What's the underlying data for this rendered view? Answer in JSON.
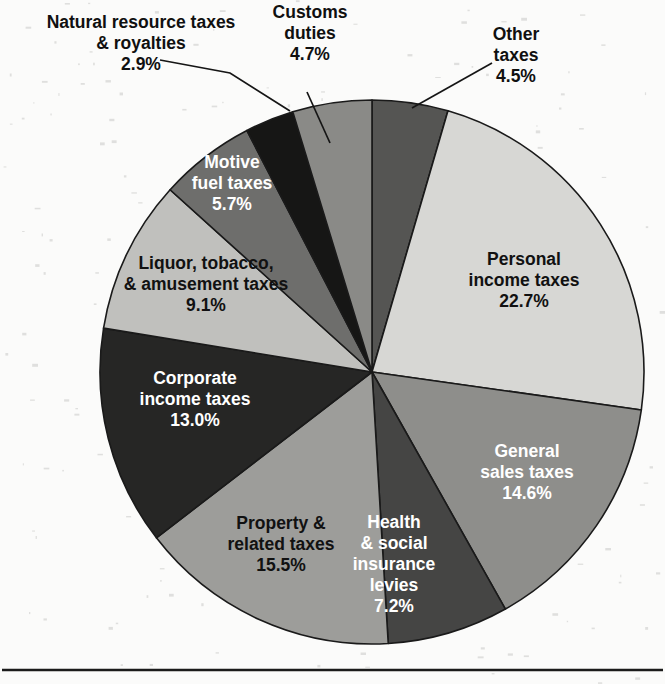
{
  "chart_data": {
    "type": "pie",
    "title": "",
    "subtitle": "",
    "xlabel": "",
    "ylabel": "",
    "legend_position": "none",
    "grid": false,
    "units": "percent",
    "total": 99.9,
    "start_angle_deg": 0,
    "direction": "clockwise",
    "center": {
      "x": 372,
      "y": 372
    },
    "radius": 272,
    "categories": [
      "Other taxes",
      "Personal income taxes",
      "General sales taxes",
      "Health & social insurance levies",
      "Property & related taxes",
      "Corporate income taxes",
      "Liquor, tobacco, & amusement taxes",
      "Motive fuel taxes",
      "Natural resource taxes & royalties",
      "Customs duties"
    ],
    "values": [
      4.5,
      22.7,
      14.6,
      7.2,
      15.5,
      13.0,
      9.1,
      5.7,
      2.9,
      4.7
    ],
    "value_labels": [
      "4.5%",
      "22.7%",
      "14.6%",
      "7.2%",
      "15.5%",
      "13.0%",
      "9.1%",
      "5.7%",
      "2.9%",
      "4.7%"
    ],
    "slice_colors": [
      "#555553",
      "#d7d7d4",
      "#8e8e8b",
      "#454544",
      "#9d9d9a",
      "#262625",
      "#c0c0bd",
      "#6e6e6c",
      "#161615",
      "#8a8a87"
    ],
    "slices": [
      {
        "name": "other-taxes",
        "label_lines": [
          "Other",
          "taxes"
        ],
        "value_label": "4.5%",
        "value": 4.5,
        "color": "#555553",
        "label_placement": "callout",
        "text_color": "#101010",
        "label_x": 516,
        "label_y": 56,
        "leader": "M 412 108 L 492 63"
      },
      {
        "name": "personal-income-taxes",
        "label_lines": [
          "Personal",
          "income taxes"
        ],
        "value_label": "22.7%",
        "value": 22.7,
        "color": "#d7d7d4",
        "label_placement": "inside",
        "text_color": "#111111",
        "label_x": 524,
        "label_y": 281
      },
      {
        "name": "general-sales-taxes",
        "label_lines": [
          "General",
          "sales taxes"
        ],
        "value_label": "14.6%",
        "value": 14.6,
        "color": "#8e8e8b",
        "label_placement": "inside",
        "text_color": "#ffffff",
        "label_x": 527,
        "label_y": 473
      },
      {
        "name": "health-social-insurance-levies",
        "label_lines": [
          "Health",
          "& social",
          "insurance",
          "levies"
        ],
        "value_label": "7.2%",
        "value": 7.2,
        "color": "#454544",
        "label_placement": "inside",
        "text_color": "#ffffff",
        "label_x": 394,
        "label_y": 565
      },
      {
        "name": "property-related-taxes",
        "label_lines": [
          "Property &",
          "related taxes"
        ],
        "value_label": "15.5%",
        "value": 15.5,
        "color": "#9d9d9a",
        "label_placement": "inside",
        "text_color": "#111111",
        "label_x": 281,
        "label_y": 545
      },
      {
        "name": "corporate-income-taxes",
        "label_lines": [
          "Corporate",
          "income taxes"
        ],
        "value_label": "13.0%",
        "value": 13.0,
        "color": "#262625",
        "label_placement": "inside",
        "text_color": "#ffffff",
        "label_x": 195,
        "label_y": 400
      },
      {
        "name": "liquor-tobacco-amusement-taxes",
        "label_lines": [
          "Liquor, tobacco,",
          "& amusement taxes"
        ],
        "value_label": "9.1%",
        "value": 9.1,
        "color": "#c0c0bd",
        "label_placement": "inside",
        "text_color": "#111111",
        "label_x": 206,
        "label_y": 285
      },
      {
        "name": "motive-fuel-taxes",
        "label_lines": [
          "Motive",
          "fuel taxes"
        ],
        "value_label": "5.7%",
        "value": 5.7,
        "color": "#6e6e6c",
        "label_placement": "inside",
        "text_color": "#ffffff",
        "label_x": 232,
        "label_y": 184
      },
      {
        "name": "natural-resource-taxes-royalties",
        "label_lines": [
          "Natural resource taxes",
          "& royalties"
        ],
        "value_label": "2.9%",
        "value": 2.9,
        "color": "#161615",
        "label_placement": "callout",
        "text_color": "#101010",
        "label_x": 141,
        "label_y": 44,
        "leader": "M 160 60 L 230 73 L 290 111"
      },
      {
        "name": "customs-duties",
        "label_lines": [
          "Customs",
          "duties"
        ],
        "value_label": "4.7%",
        "value": 4.7,
        "color": "#8a8a87",
        "label_placement": "callout",
        "text_color": "#101010",
        "label_x": 310,
        "label_y": 34,
        "leader": "M 307 92 L 330 143"
      }
    ]
  },
  "page": {
    "background_color": "#fbfbfa",
    "rule_color": "#1b1b1b"
  }
}
